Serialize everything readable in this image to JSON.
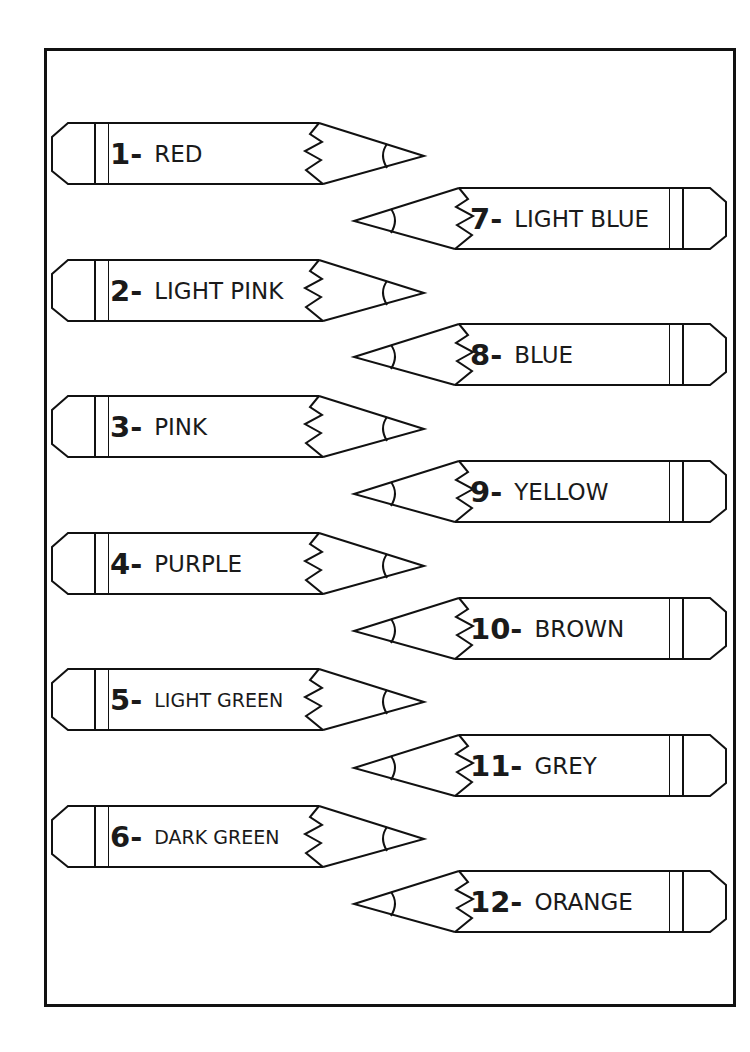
{
  "worksheet": {
    "title": "",
    "pencils": [
      {
        "number": "1-",
        "color_name": "RED",
        "direction": "right-pointing",
        "side": "left"
      },
      {
        "number": "2-",
        "color_name": "LIGHT PINK",
        "direction": "right-pointing",
        "side": "left"
      },
      {
        "number": "3-",
        "color_name": "PINK",
        "direction": "right-pointing",
        "side": "left"
      },
      {
        "number": "4-",
        "color_name": "PURPLE",
        "direction": "right-pointing",
        "side": "left"
      },
      {
        "number": "5-",
        "color_name": "LIGHT GREEN",
        "direction": "right-pointing",
        "side": "left"
      },
      {
        "number": "6-",
        "color_name": "DARK GREEN",
        "direction": "right-pointing",
        "side": "left"
      },
      {
        "number": "7-",
        "color_name": "LIGHT BLUE",
        "direction": "left-pointing",
        "side": "right"
      },
      {
        "number": "8-",
        "color_name": "BLUE",
        "direction": "left-pointing",
        "side": "right"
      },
      {
        "number": "9-",
        "color_name": "YELLOW",
        "direction": "left-pointing",
        "side": "right"
      },
      {
        "number": "10-",
        "color_name": "BROWN",
        "direction": "left-pointing",
        "side": "right"
      },
      {
        "number": "11-",
        "color_name": "GREY",
        "direction": "left-pointing",
        "side": "right"
      },
      {
        "number": "12-",
        "color_name": "ORANGE",
        "direction": "left-pointing",
        "side": "right"
      }
    ]
  },
  "colors": {
    "outline": "#111111",
    "background": "#ffffff",
    "text": "#1a1a1a"
  }
}
